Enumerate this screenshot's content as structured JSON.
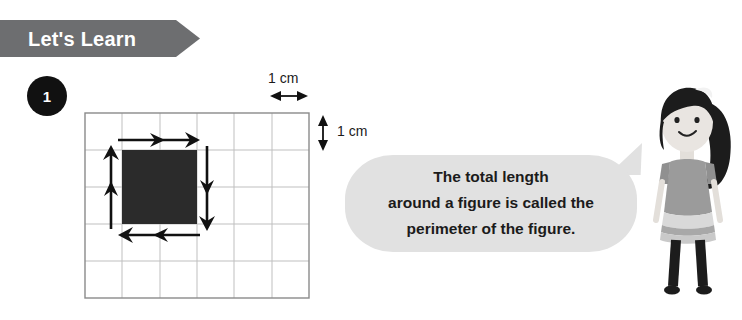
{
  "header": {
    "banner_label": "Let's Learn",
    "banner_color": "#6d6e70",
    "banner_text_color": "#ffffff"
  },
  "item": {
    "number": "1",
    "badge_color": "#111111",
    "badge_text_color": "#ffffff"
  },
  "figure": {
    "grid": {
      "columns": 6,
      "rows": 5,
      "cell_size_cm": 1,
      "line_color": "#b9b9b9",
      "border_color": "#7d7d7d"
    },
    "shaded_shape": {
      "name": "square",
      "width_cells": 2,
      "height_cells": 2,
      "fill_color": "#2b2b2b",
      "start_col": 1,
      "start_row": 1
    },
    "measure_labels": {
      "horizontal": "1 cm",
      "vertical": "1 cm"
    },
    "perimeter_arrows": [
      {
        "side": "top",
        "direction": "right",
        "segments": 2
      },
      {
        "side": "right",
        "direction": "down",
        "segments": 2
      },
      {
        "side": "bottom",
        "direction": "left",
        "segments": 2
      },
      {
        "side": "left",
        "direction": "up",
        "segments": 2
      }
    ]
  },
  "callout": {
    "bubble_color": "#e1e1e1",
    "lines": [
      {
        "text": "The total length",
        "emphasis": false
      },
      {
        "text": "around a figure is called the",
        "emphasis": false
      }
    ],
    "final_line": {
      "keyword": "perimeter",
      "rest": " of the figure."
    }
  },
  "character": {
    "name": "girl-student",
    "hair_color": "#1c1c1c",
    "skin_color": "#e8e4e0",
    "dress_color": "#9e9e9e",
    "legs_color": "#1c1c1c"
  }
}
